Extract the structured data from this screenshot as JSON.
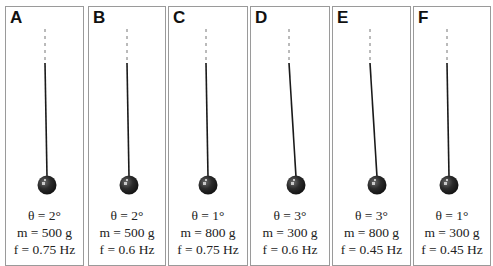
{
  "panels": [
    {
      "label": "A",
      "theta": "θ = 2°",
      "mass": "m = 500 g",
      "freq": "f = 0.75 Hz",
      "left": 5,
      "width": 79,
      "pivot_x": 39,
      "bob_x": 41
    },
    {
      "label": "B",
      "theta": "θ = 2°",
      "mass": "m = 500 g",
      "freq": "f = 0.6 Hz",
      "left": 88,
      "width": 78,
      "pivot_x": 38,
      "bob_x": 40
    },
    {
      "label": "C",
      "theta": "θ = 1°",
      "mass": "m = 800 g",
      "freq": "f = 0.75 Hz",
      "left": 168,
      "width": 80,
      "pivot_x": 37,
      "bob_x": 39
    },
    {
      "label": "D",
      "theta": "θ = 3°",
      "mass": "m = 300 g",
      "freq": "f = 0.6 Hz",
      "left": 250,
      "width": 80,
      "pivot_x": 38,
      "bob_x": 45
    },
    {
      "label": "E",
      "theta": "θ = 3°",
      "mass": "m = 800 g",
      "freq": "f = 0.45 Hz",
      "left": 332,
      "width": 79,
      "pivot_x": 37,
      "bob_x": 44
    },
    {
      "label": "F",
      "theta": "θ = 1°",
      "mass": "m = 300 g",
      "freq": "f = 0.45 Hz",
      "left": 413,
      "width": 78,
      "pivot_x": 33,
      "bob_x": 35
    }
  ],
  "colors": {
    "border": "#9a9a9a",
    "string": "#1a1a1a",
    "bob": "#2b2b2b"
  }
}
